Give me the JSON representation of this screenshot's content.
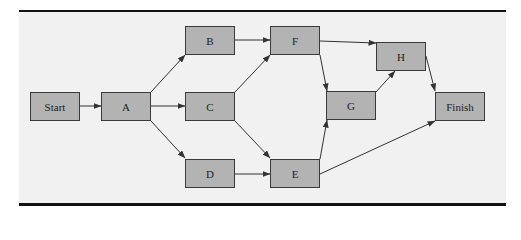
{
  "diagram": {
    "type": "activity-network",
    "colors": {
      "node_fill": "#b3b3b3",
      "node_border": "#3a3a3a",
      "background": "#f1f1f1",
      "rule": "#111111",
      "edge": "#333333"
    },
    "nodes": [
      {
        "id": "start",
        "label": "Start",
        "x": 30,
        "y": 92
      },
      {
        "id": "a",
        "label": "A",
        "x": 101,
        "y": 92
      },
      {
        "id": "b",
        "label": "B",
        "x": 185,
        "y": 26
      },
      {
        "id": "c",
        "label": "C",
        "x": 185,
        "y": 92
      },
      {
        "id": "d",
        "label": "D",
        "x": 185,
        "y": 159
      },
      {
        "id": "f",
        "label": "F",
        "x": 270,
        "y": 26
      },
      {
        "id": "e",
        "label": "E",
        "x": 270,
        "y": 159
      },
      {
        "id": "g",
        "label": "G",
        "x": 326,
        "y": 91
      },
      {
        "id": "h",
        "label": "H",
        "x": 376,
        "y": 42
      },
      {
        "id": "finish",
        "label": "Finish",
        "x": 435,
        "y": 92
      }
    ],
    "edges": [
      [
        "Start",
        "A"
      ],
      [
        "A",
        "B"
      ],
      [
        "A",
        "C"
      ],
      [
        "A",
        "D"
      ],
      [
        "B",
        "F"
      ],
      [
        "C",
        "F"
      ],
      [
        "C",
        "E"
      ],
      [
        "D",
        "E"
      ],
      [
        "F",
        "G"
      ],
      [
        "F",
        "H"
      ],
      [
        "E",
        "G"
      ],
      [
        "E",
        "Finish"
      ],
      [
        "G",
        "H"
      ],
      [
        "H",
        "Finish"
      ]
    ]
  }
}
